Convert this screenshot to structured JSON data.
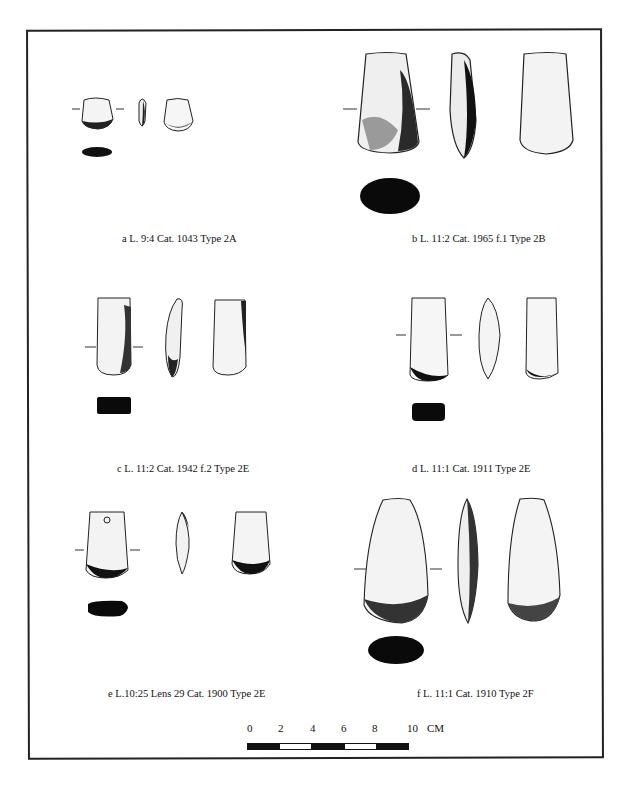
{
  "figure": {
    "panels": [
      {
        "id": "a",
        "caption": "a L. 9:4 Cat. 1043 Type 2A"
      },
      {
        "id": "b",
        "caption": "b L. 11:2 Cat. 1965 f.1 Type 2B"
      },
      {
        "id": "c",
        "caption": "c L. 11:2 Cat. 1942 f.2 Type 2E"
      },
      {
        "id": "d",
        "caption": "d L. 11:1 Cat. 1911 Type 2E"
      },
      {
        "id": "e",
        "caption": "e L.10:25 Lens 29 Cat. 1900 Type 2E"
      },
      {
        "id": "f",
        "caption": "f L. 11:1 Cat. 1910 Type 2F"
      }
    ],
    "scale": {
      "ticks": [
        "0",
        "2",
        "4",
        "6",
        "8",
        "10"
      ],
      "unit": "CM",
      "segments": [
        "black",
        "white",
        "black",
        "white",
        "black"
      ]
    }
  }
}
